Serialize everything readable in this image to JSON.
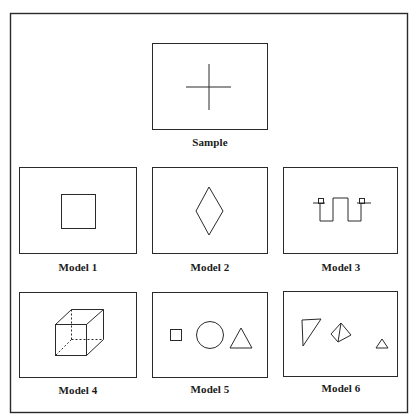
{
  "figure": {
    "panels": [
      {
        "id": "sample",
        "label": "Sample",
        "shape": "cross"
      },
      {
        "id": "model-1",
        "label": "Model 1",
        "shape": "square"
      },
      {
        "id": "model-2",
        "label": "Model 2",
        "shape": "diamond"
      },
      {
        "id": "model-3",
        "label": "Model 3",
        "shape": "square-wave-with-end-squares"
      },
      {
        "id": "model-4",
        "label": "Model 4",
        "shape": "wireframe-cube"
      },
      {
        "id": "model-5",
        "label": "Model 5",
        "shape": "square-circle-triangle"
      },
      {
        "id": "model-6",
        "label": "Model 6",
        "shape": "right-triangle-tetrahedron-small-triangle"
      }
    ],
    "colors": {
      "line": "#2a2a2a",
      "background": "#ffffff"
    }
  }
}
